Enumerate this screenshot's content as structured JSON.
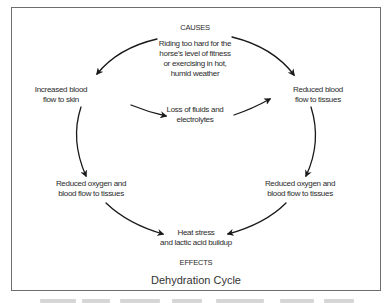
{
  "diagram": {
    "title": "Dehydration Cycle",
    "header_label": "CAUSES",
    "footer_label": "EFFECTS",
    "nodes": {
      "cause": {
        "lines": [
          "Riding too hard for the",
          "horse's level of fitness",
          "or exercising in hot,",
          "humid weather"
        ]
      },
      "left_top": {
        "lines": [
          "Increased blood",
          "flow to skin"
        ]
      },
      "right_top": {
        "lines": [
          "Reduced blood",
          "flow to tissues"
        ]
      },
      "middle": {
        "lines": [
          "Loss of fluids and",
          "electrolytes"
        ]
      },
      "left_bottom": {
        "lines": [
          "Reduced oxygen and",
          "blood flow to tissues"
        ]
      },
      "right_bottom": {
        "lines": [
          "Reduced oxygen and",
          "blood flow to tissues"
        ]
      },
      "effect": {
        "lines": [
          "Heat stress",
          "and lactic acid buildup"
        ]
      }
    },
    "edges": [
      {
        "from": "cause",
        "to": "left_top"
      },
      {
        "from": "cause",
        "to": "right_top"
      },
      {
        "from": "left_top",
        "to": "middle"
      },
      {
        "from": "middle",
        "to": "right_top"
      },
      {
        "from": "left_top",
        "to": "left_bottom"
      },
      {
        "from": "right_top",
        "to": "right_bottom"
      },
      {
        "from": "left_bottom",
        "to": "effect"
      },
      {
        "from": "right_bottom",
        "to": "effect"
      }
    ],
    "colors": {
      "frame": "#6e6e6e",
      "arrow": "#1a1a1a",
      "text": "#2b2b2b"
    }
  }
}
